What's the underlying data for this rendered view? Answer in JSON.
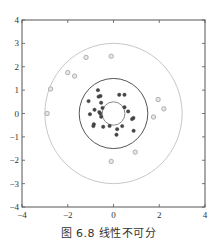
{
  "chart_data": {
    "type": "scatter",
    "title": "",
    "caption": "图 6.8   线性不可分",
    "xlabel": "",
    "ylabel": "",
    "xlim": [
      -4,
      4
    ],
    "ylim": [
      -4,
      4
    ],
    "xticks": [
      -4,
      -2,
      0,
      2,
      4
    ],
    "yticks": [
      -4,
      -3,
      -2,
      -1,
      0,
      1,
      2,
      3,
      4
    ],
    "xtick_labels": [
      "−4",
      "−2",
      "0",
      "2",
      "4"
    ],
    "ytick_labels": [
      "−4",
      "−3",
      "−2",
      "−1",
      "0",
      "1",
      "2",
      "3",
      "4"
    ],
    "grid": false,
    "circles": [
      {
        "name": "inner-boundary",
        "center": [
          0,
          0
        ],
        "radius": 0.5,
        "color": "#8a8a8a"
      },
      {
        "name": "middle-boundary",
        "center": [
          0,
          0
        ],
        "radius": 1.5,
        "color": "#555555"
      },
      {
        "name": "outer-boundary",
        "center": [
          0,
          0
        ],
        "radius": 3.0,
        "color": "#c8c8c8"
      }
    ],
    "series": [
      {
        "name": "inner-class",
        "marker": "filled-circle",
        "color": "#444444",
        "points": [
          [
            -0.68,
            1.0
          ],
          [
            -0.65,
            0.72
          ],
          [
            -0.57,
            0.75
          ],
          [
            -1.09,
            0.53
          ],
          [
            -0.54,
            0.46
          ],
          [
            -0.83,
            0.16
          ],
          [
            -1.03,
            -0.03
          ],
          [
            -0.62,
            0.06
          ],
          [
            -0.58,
            0.0
          ],
          [
            -0.48,
            0.24
          ],
          [
            -0.54,
            -0.14
          ],
          [
            -0.86,
            -0.46
          ],
          [
            -0.88,
            -0.54
          ],
          [
            -0.45,
            -0.57
          ],
          [
            -0.17,
            -0.53
          ],
          [
            0.25,
            0.8
          ],
          [
            0.48,
            0.8
          ],
          [
            0.48,
            0.27
          ],
          [
            0.64,
            0.09
          ],
          [
            0.87,
            -0.19
          ],
          [
            0.81,
            -0.24
          ],
          [
            0.38,
            -0.54
          ],
          [
            0.16,
            -0.67
          ],
          [
            0.13,
            -0.91
          ],
          [
            0.88,
            -0.74
          ]
        ]
      },
      {
        "name": "outer-class",
        "marker": "hollow-circle",
        "color": "#a8a8a8",
        "points": [
          [
            -1.2,
            2.4
          ],
          [
            -0.1,
            2.45
          ],
          [
            -2.0,
            1.75
          ],
          [
            -1.7,
            1.6
          ],
          [
            -2.75,
            1.05
          ],
          [
            -2.9,
            0.0
          ],
          [
            1.95,
            0.6
          ],
          [
            2.2,
            0.2
          ],
          [
            1.75,
            -0.15
          ],
          [
            0.95,
            -1.65
          ],
          [
            -0.1,
            -2.05
          ]
        ]
      }
    ]
  }
}
